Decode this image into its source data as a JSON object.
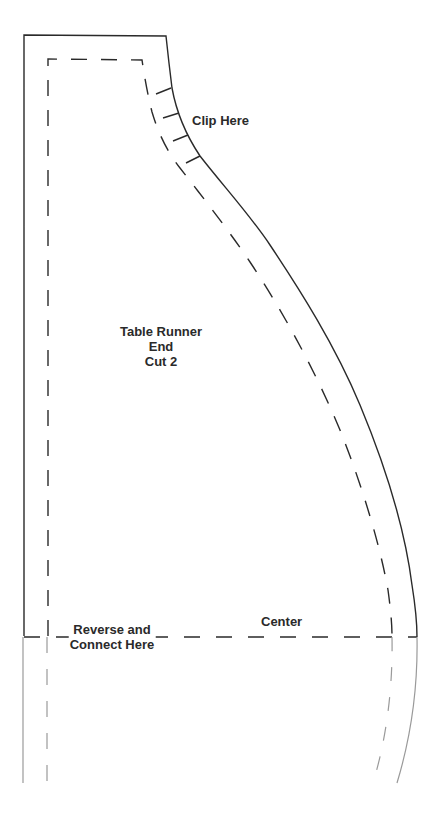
{
  "document": {
    "type": "sewing-pattern-piece",
    "piece": {
      "title_line1": "Table Runner",
      "title_line2": "End",
      "title_line3": "Cut 2"
    },
    "labels": {
      "clip": "Clip Here",
      "center": "Center",
      "reverse_line1": "Reverse and",
      "reverse_line2": "Connect Here"
    },
    "colors": {
      "cut_line": "#2a2a2a",
      "seam_line": "#2a2a2a",
      "mirror_line": "#9a9a9a",
      "paper": "#ffffff"
    },
    "clip_marks_count": 4
  }
}
